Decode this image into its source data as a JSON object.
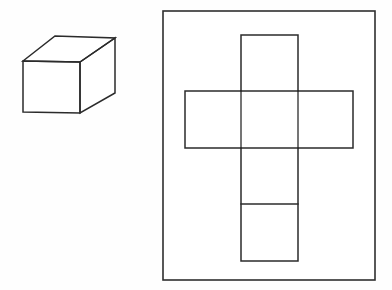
{
  "figure": {
    "background_color": "#fefefe",
    "line_color": "#2b2b2b",
    "fill_color": "#ffffff",
    "width": 392,
    "height": 290,
    "caption": ""
  },
  "cube": {
    "label": "cube",
    "description": "Three-dimensional rectangular box drawn in oblique projection showing front face, top face and right face",
    "faces": [
      {
        "name": "front-face",
        "points": "23,61 80,62 80,113 23,112"
      },
      {
        "name": "top-face",
        "points": "23,61 55,36 115,38 80,62"
      },
      {
        "name": "right-face",
        "points": "80,62 115,38 115,93 80,113"
      }
    ],
    "vertices": {
      "front_top_left": "23,61",
      "front_top_right": "80,62",
      "front_bottom_right": "80,113",
      "front_bottom_left": "23,112",
      "back_top_left": "55,36",
      "back_top_right": "115,38",
      "back_bottom_right": "115,93"
    }
  },
  "net_panel": {
    "label": "net-panel",
    "description": "Outer rectangular frame enclosing the unfolded cube net",
    "rect": {
      "x": 163,
      "y": 11,
      "width": 212,
      "height": 269
    }
  },
  "net": {
    "label": "cube-net",
    "description": "Cross-shaped arrangement of six squares forming the unfolded surface of the cube",
    "squares": [
      {
        "name": "net-square-top",
        "x": 241,
        "y": 35,
        "width": 57,
        "height": 56
      },
      {
        "name": "net-square-left",
        "x": 185,
        "y": 91,
        "width": 56,
        "height": 57
      },
      {
        "name": "net-square-center",
        "x": 241,
        "y": 91,
        "width": 57,
        "height": 57
      },
      {
        "name": "net-square-right",
        "x": 298,
        "y": 91,
        "width": 55,
        "height": 57
      },
      {
        "name": "net-square-below-center",
        "x": 241,
        "y": 148,
        "width": 57,
        "height": 56
      },
      {
        "name": "net-square-bottom",
        "x": 241,
        "y": 204,
        "width": 57,
        "height": 57
      }
    ],
    "outline_path": "M241,35 L298,35 L298,91 L353,91 L353,148 L298,148 L298,261 L241,261 L241,148 L185,148 L185,91 L241,91 Z",
    "internal_lines": [
      {
        "name": "net-fold-line-top-center",
        "x1": 241,
        "y1": 91,
        "x2": 298,
        "y2": 91
      },
      {
        "name": "net-fold-line-center-bottom",
        "x1": 241,
        "y1": 148,
        "x2": 298,
        "y2": 148
      },
      {
        "name": "net-fold-line-lower",
        "x1": 241,
        "y1": 204,
        "x2": 298,
        "y2": 204
      },
      {
        "name": "net-fold-line-left-center",
        "x1": 241,
        "y1": 91,
        "x2": 241,
        "y2": 148
      },
      {
        "name": "net-fold-line-center-right",
        "x1": 298,
        "y1": 91,
        "x2": 298,
        "y2": 148
      }
    ]
  }
}
